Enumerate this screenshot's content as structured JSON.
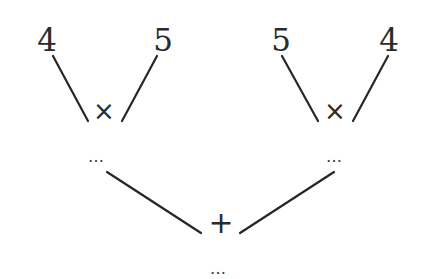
{
  "diagram": {
    "type": "expression-tree",
    "left_subtree": {
      "operator": "×",
      "left_operand": "4",
      "right_operand": "5",
      "result": "..."
    },
    "right_subtree": {
      "operator": "×",
      "left_operand": "5",
      "right_operand": "4",
      "result": "..."
    },
    "root": {
      "operator": "+",
      "result": "..."
    },
    "colors": {
      "ink": "#2b2b2b",
      "background": "#ffffff"
    }
  }
}
